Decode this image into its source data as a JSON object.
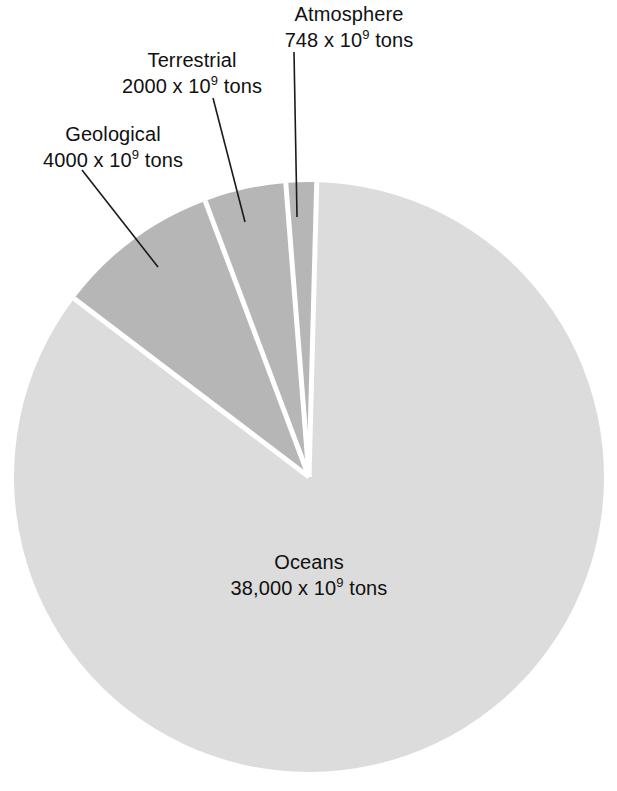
{
  "chart_data": {
    "type": "pie",
    "title": "",
    "unit": "x 10^9 tons",
    "total": 44748,
    "categories": [
      "Oceans",
      "Geological",
      "Terrestrial",
      "Atmosphere"
    ],
    "values": [
      38000,
      4000,
      2000,
      748
    ],
    "value_labels": [
      "38,000",
      "4000",
      "2000",
      "748"
    ],
    "percentages": [
      84.92,
      8.94,
      4.47,
      1.67
    ],
    "legend_position": "none",
    "grid": false,
    "slices": [
      {
        "name": "Oceans",
        "value": 38000,
        "value_label": "38,000",
        "unit_prefix": "x 10",
        "unit_exponent": "9",
        "unit_suffix": "tons",
        "percent": 84.92,
        "color": "#dcdcdc",
        "label_placement": "inside",
        "start_angle_deg": 10.0,
        "end_angle_deg": 315.7
      },
      {
        "name": "Geological",
        "value": 4000,
        "value_label": "4000",
        "unit_prefix": "x 10",
        "unit_exponent": "9",
        "unit_suffix": "tons",
        "percent": 8.94,
        "color": "#b6b6b6",
        "label_placement": "callout",
        "start_angle_deg": 317.2,
        "end_angle_deg": 349.4
      },
      {
        "name": "Terrestrial",
        "value": 2000,
        "value_label": "2000",
        "unit_prefix": "x 10",
        "unit_exponent": "9",
        "unit_suffix": "tons",
        "percent": 4.47,
        "color": "#b6b6b6",
        "label_placement": "callout",
        "start_angle_deg": 350.9,
        "end_angle_deg": 367.0
      },
      {
        "name": "Atmosphere",
        "value": 748,
        "value_label": "748",
        "unit_prefix": "x 10",
        "unit_exponent": "9",
        "unit_suffix": "tons",
        "percent": 1.67,
        "color": "#b6b6b6",
        "label_placement": "callout",
        "start_angle_deg": 368.5,
        "end_angle_deg": 374.5
      }
    ],
    "geometry": {
      "center_x": 309,
      "center_y": 477,
      "radius": 295,
      "separator_color": "#ffffff",
      "separator_width": 5
    },
    "background_color": "#ffffff",
    "text_color": "#111111",
    "leader_line_color": "#1a1a1a"
  },
  "labels": {
    "geological": {
      "name": "Geological",
      "value": "4000 x 10",
      "exponent": "9",
      "suffix": " tons"
    },
    "terrestrial": {
      "name": "Terrestrial",
      "value": "2000 x 10",
      "exponent": "9",
      "suffix": " tons"
    },
    "atmosphere": {
      "name": "Atmosphere",
      "value": "748 x 10",
      "exponent": "9",
      "suffix": " tons"
    },
    "oceans": {
      "name": "Oceans",
      "value": "38,000 x 10",
      "exponent": "9",
      "suffix": " tons"
    }
  }
}
